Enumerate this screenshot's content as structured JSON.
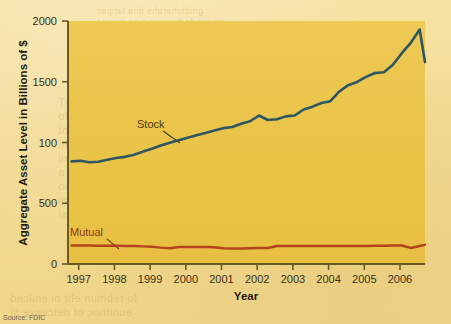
{
  "figure": {
    "source_note": "Source: FDIC",
    "page_background_color": "#f2da93",
    "plot_background_color": "#edc44b",
    "axis_color": "#6b5a22"
  },
  "bleed_through_text": {
    "line1": "gnidloherahs dna latipac",
    "line2": "stessa fo tnecrep a sa latipac",
    "line3": "sknab fo rebmun ehT",
    "line4": "ot eunitnoc sknab fo",
    "line5": "era sknab reward eht",
    "line6": "eht fo tluser a si siht",
    "line7": "sknab fo rebmun eht ni",
    "line8": "dna segrem fo tluser a",
    "line9": "noitadilosnoc gniogno",
    "line10": "yrtsudni gniknab eht ni",
    "line11": "deunitnoc ot detcepxe si",
    "line12": "fo rebmun eht ni enilced",
    "line13": "eunitnoc ot detcepxe si"
  },
  "chart_data": {
    "type": "line",
    "title": "",
    "xlabel": "Year",
    "ylabel": "Aggregate Asset Level in Billions of $",
    "xlim": [
      1996.6,
      2006.6
    ],
    "ylim": [
      0,
      2000
    ],
    "grid": false,
    "legend_position": "inline-annotations",
    "x_tick_labels": [
      "1997",
      "1998",
      "1999",
      "2000",
      "2001",
      "2002",
      "2003",
      "2004",
      "2005",
      "2006"
    ],
    "x_ticks": [
      1997,
      1998,
      1999,
      2000,
      2001,
      2002,
      2003,
      2004,
      2005,
      2006
    ],
    "y_tick_labels": [
      "0",
      "500",
      "100",
      "1500",
      "2000"
    ],
    "y_ticks": [
      0,
      500,
      1000,
      1500,
      2000
    ],
    "annotations": [
      {
        "text": "Stock",
        "series": "Stock",
        "color": "#4a3a12"
      },
      {
        "text": "Mutual",
        "series": "Mutual",
        "color": "#8f3a1a"
      }
    ],
    "series": [
      {
        "name": "Stock",
        "color": "#2c5663",
        "x": [
          1996.7,
          1996.95,
          1997.2,
          1997.45,
          1997.7,
          1997.95,
          1998.2,
          1998.45,
          1998.7,
          1998.95,
          1999.2,
          1999.45,
          1999.7,
          1999.95,
          2000.2,
          2000.45,
          2000.7,
          2000.95,
          2001.2,
          2001.45,
          2001.7,
          2001.95,
          2002.2,
          2002.45,
          2002.7,
          2002.95,
          2003.2,
          2003.45,
          2003.7,
          2003.95,
          2004.2,
          2004.45,
          2004.7,
          2004.95,
          2005.2,
          2005.45,
          2005.7,
          2005.95,
          2006.2,
          2006.45,
          2006.6
        ],
        "values": [
          845,
          850,
          838,
          842,
          858,
          872,
          882,
          900,
          925,
          948,
          975,
          998,
          1018,
          1040,
          1060,
          1078,
          1098,
          1118,
          1128,
          1155,
          1175,
          1222,
          1185,
          1192,
          1215,
          1222,
          1272,
          1295,
          1325,
          1340,
          1420,
          1472,
          1498,
          1540,
          1572,
          1578,
          1640,
          1735,
          1820,
          1930,
          1662
        ]
      },
      {
        "name": "Mutual",
        "color": "#b2441c",
        "x": [
          1996.7,
          1996.95,
          1997.2,
          1997.45,
          1997.7,
          1997.95,
          1998.2,
          1998.45,
          1998.7,
          1998.95,
          1999.2,
          1999.45,
          1999.7,
          1999.95,
          2000.2,
          2000.45,
          2000.7,
          2000.95,
          2001.2,
          2001.45,
          2001.7,
          2001.95,
          2002.2,
          2002.45,
          2002.7,
          2002.95,
          2003.2,
          2003.45,
          2003.7,
          2003.95,
          2004.2,
          2004.45,
          2004.7,
          2004.95,
          2005.2,
          2005.45,
          2005.7,
          2005.95,
          2006.2,
          2006.45,
          2006.6
        ],
        "values": [
          152,
          152,
          152,
          150,
          150,
          150,
          148,
          148,
          145,
          142,
          135,
          130,
          140,
          140,
          140,
          140,
          138,
          130,
          128,
          128,
          130,
          132,
          132,
          148,
          148,
          148,
          148,
          148,
          148,
          148,
          148,
          148,
          148,
          148,
          150,
          150,
          152,
          152,
          132,
          148,
          158
        ]
      }
    ]
  }
}
